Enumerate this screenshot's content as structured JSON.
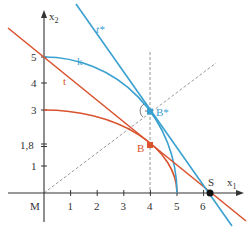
{
  "diagram": {
    "type": "geometric-construction",
    "colors": {
      "axis": "#333333",
      "red": "#d9532e",
      "blue": "#3aa0d0",
      "dashed": "#9a9a9a",
      "vertical_dashed": "#d9532e"
    },
    "axes": {
      "x_label": "x",
      "x_sub": "1",
      "y_label": "x",
      "y_sub": "2",
      "origin_label": "M",
      "x_ticks": [
        "1",
        "2",
        "3",
        "4",
        "5",
        "6"
      ],
      "y_ticks": [
        "1",
        "1,8",
        "3",
        "4",
        "5"
      ]
    },
    "labels": {
      "k": "k",
      "t": "t",
      "t_star": "t*",
      "B": "B",
      "B_star": "B*",
      "S": "S"
    },
    "points": {
      "B": [
        4,
        1.8
      ],
      "B_star": [
        4,
        3
      ],
      "S": [
        6.25,
        0
      ]
    },
    "curves": {
      "ellipse_red": {
        "a": 5,
        "b": 3
      },
      "circle_blue_k": {
        "a": 5,
        "b": 5
      }
    }
  }
}
